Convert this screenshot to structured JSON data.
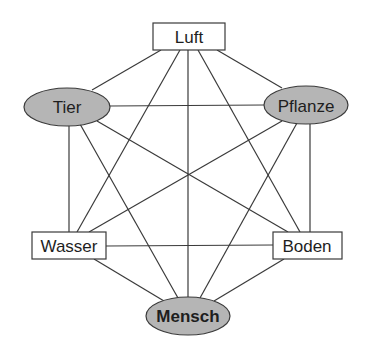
{
  "diagram": {
    "type": "complete-graph",
    "nodes": [
      {
        "id": "luft",
        "label": "Luft",
        "shape": "rectangle",
        "fill": "#ffffff"
      },
      {
        "id": "tier",
        "label": "Tier",
        "shape": "ellipse",
        "fill": "#b5b5b5"
      },
      {
        "id": "pflanze",
        "label": "Pflanze",
        "shape": "ellipse",
        "fill": "#b5b5b5"
      },
      {
        "id": "wasser",
        "label": "Wasser",
        "shape": "rectangle",
        "fill": "#ffffff"
      },
      {
        "id": "boden",
        "label": "Boden",
        "shape": "rectangle",
        "fill": "#ffffff"
      },
      {
        "id": "mensch",
        "label": "Mensch",
        "shape": "ellipse",
        "fill": "#b5b5b5",
        "bold": true
      }
    ],
    "edges": [
      [
        "luft",
        "tier"
      ],
      [
        "luft",
        "pflanze"
      ],
      [
        "luft",
        "wasser"
      ],
      [
        "luft",
        "boden"
      ],
      [
        "luft",
        "mensch"
      ],
      [
        "tier",
        "pflanze"
      ],
      [
        "tier",
        "wasser"
      ],
      [
        "tier",
        "boden"
      ],
      [
        "tier",
        "mensch"
      ],
      [
        "pflanze",
        "wasser"
      ],
      [
        "pflanze",
        "boden"
      ],
      [
        "pflanze",
        "mensch"
      ],
      [
        "wasser",
        "boden"
      ],
      [
        "wasser",
        "mensch"
      ],
      [
        "boden",
        "mensch"
      ]
    ]
  }
}
